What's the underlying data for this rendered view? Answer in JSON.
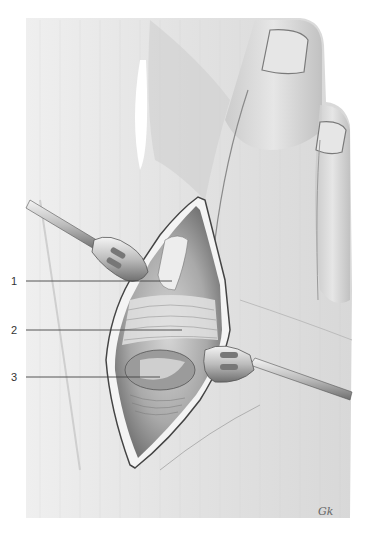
{
  "figure": {
    "type": "surgical-illustration",
    "labels": [
      {
        "number": "1",
        "y": 281
      },
      {
        "number": "2",
        "y": 330
      },
      {
        "number": "3",
        "y": 377
      }
    ],
    "signature": "Gk",
    "colors": {
      "background": "#ffffff",
      "skin_light": "#ececec",
      "skin_mid": "#d2d2d2",
      "skin_dark": "#a8a8a8",
      "outline": "#555555",
      "leader_line": "#444444",
      "label_text": "#333333"
    }
  }
}
